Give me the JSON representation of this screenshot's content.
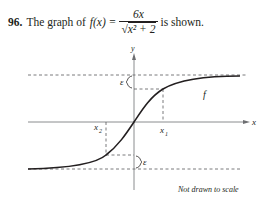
{
  "problem": {
    "number": "96.",
    "text_before": "The graph of",
    "function_lhs": "f(x) =",
    "numerator": "6x",
    "denominator_radical": "√",
    "denominator_inner": "x² + 2",
    "text_after": "is shown."
  },
  "graph": {
    "axis_x_label": "x",
    "axis_y_label": "y",
    "curve_label": "f",
    "epsilon_upper_label": "ε",
    "epsilon_lower_label": "ε",
    "x1_label": "x",
    "x1_sub": "1",
    "x2_label": "x",
    "x2_sub": "2",
    "note": "Not drawn to scale"
  },
  "colors": {
    "ink": "#231f20",
    "axis": "#6d6e71",
    "dash": "#58595b"
  }
}
